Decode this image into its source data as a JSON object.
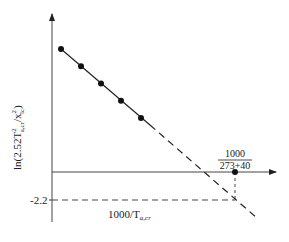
{
  "diagram": {
    "y_axis_label_main": "ln(2.52T",
    "y_axis_label_sup": "2",
    "y_axis_label_sub": "a,cr",
    "y_axis_label_rest": "/x",
    "y_axis_label_sup2": "2",
    "y_axis_label_sub2": "lc",
    "y_axis_label_end": ")",
    "x_axis_label_main": "1000/T",
    "x_axis_label_sub": "a,cr",
    "y_tick_label": "-2.2",
    "annotation_numerator": "1000",
    "annotation_denominator": "273+40",
    "points_count": 5,
    "colors": {
      "ink": "#222222",
      "background": "#ffffff"
    }
  }
}
